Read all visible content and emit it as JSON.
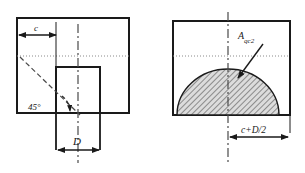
{
  "figure": {
    "name": "two-view-engineering-cross-section-diagram",
    "background_color": "#ffffff",
    "line_color": "#1a1a1a",
    "hatch_color": "#3a3a3a",
    "hatch_fill": "#d9d9d9"
  },
  "left_view": {
    "name": "left-elevation-view",
    "labels": {
      "c": "c",
      "D": "D",
      "angle": "45°"
    }
  },
  "right_view": {
    "name": "right-section-view",
    "labels": {
      "area": "Aqc2",
      "area_base": "A",
      "area_sub": "qc2",
      "width": "c+D/2"
    }
  }
}
